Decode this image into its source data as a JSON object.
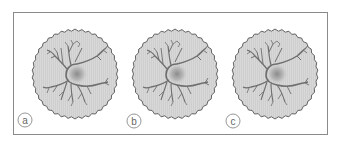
{
  "figure": {
    "panels": [
      {
        "label": "a",
        "cx": 75,
        "cy": 74,
        "label_x": 25,
        "label_y": 120
      },
      {
        "label": "b",
        "cx": 175,
        "cy": 74,
        "label_x": 134,
        "label_y": 121
      },
      {
        "label": "c",
        "cx": 275,
        "cy": 74,
        "label_x": 233,
        "label_y": 121
      }
    ],
    "colors": {
      "frame": "#8a8a8a",
      "disc_fill": "#d6d6d6",
      "disc_edge": "#555555",
      "neuron": "#6e6e6e",
      "soma_center": "#8c8c8c",
      "label_stroke": "#8a8a8a",
      "label_text": "#666666"
    },
    "icons": {
      "panel_subject": "neuron-icon",
      "panel_background": "scalloped-disc"
    }
  }
}
